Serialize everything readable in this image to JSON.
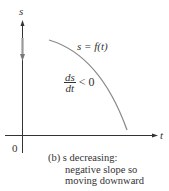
{
  "figure": {
    "axis": {
      "y_label": "s",
      "x_label": "t",
      "origin_label": "0"
    },
    "curve_label": "s = f(t)",
    "derivative": {
      "numerator": "ds",
      "denominator": "dt",
      "relation": "< 0"
    },
    "caption": {
      "line1": "(b) s decreasing:",
      "line2": "negative slope so",
      "line3": "moving downward"
    },
    "colors": {
      "axis": "#333333",
      "curve": "#8a8a8a",
      "motion_arrow": "#9a9a9a",
      "text": "#333333"
    }
  }
}
